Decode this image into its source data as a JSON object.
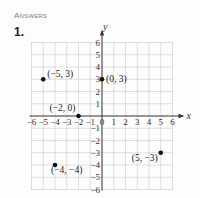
{
  "header": {
    "section_title": "Answers",
    "problem_number": "1."
  },
  "chart_data": {
    "type": "scatter",
    "title": "",
    "xlabel": "x",
    "ylabel": "y",
    "xlim": [
      -6,
      6
    ],
    "ylim": [
      -6,
      6
    ],
    "grid": true,
    "x_ticks": [
      "−6",
      "−5",
      "−4",
      "−3",
      "−2",
      "−1",
      "0",
      "1",
      "2",
      "3",
      "4",
      "5",
      "6"
    ],
    "y_ticks": [
      "6",
      "5",
      "4",
      "3",
      "2",
      "1",
      "−1",
      "−2",
      "−3",
      "−4",
      "−5",
      "−6"
    ],
    "points": [
      {
        "x": -5,
        "y": 3,
        "label": "(−5, 3)"
      },
      {
        "x": 0,
        "y": 3,
        "label": "(0, 3)"
      },
      {
        "x": -2,
        "y": 0,
        "label": "(−2, 0)"
      },
      {
        "x": -4,
        "y": -4,
        "label": "(−4, −4)"
      },
      {
        "x": 5,
        "y": -3,
        "label": "(5, −3)"
      }
    ]
  }
}
